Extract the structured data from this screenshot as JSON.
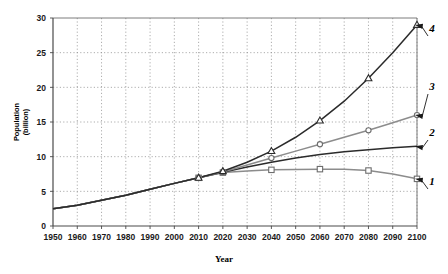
{
  "chart_data": {
    "type": "line",
    "title": "",
    "xlabel": "Year",
    "ylabel": "Population (billion)",
    "ylabel_line1": "Population",
    "ylabel_line2": "(billion)",
    "xlim": [
      1950,
      2100
    ],
    "ylim": [
      0,
      30
    ],
    "xticks": [
      1950,
      1960,
      1970,
      1980,
      1990,
      2000,
      2010,
      2020,
      2030,
      2040,
      2050,
      2060,
      2070,
      2080,
      2090,
      2100
    ],
    "yticks": [
      0,
      5,
      10,
      15,
      20,
      25,
      30
    ],
    "xtick_labels": [
      "1950",
      "1960",
      "1970",
      "1980",
      "1990",
      "2000",
      "2010",
      "2020",
      "2030",
      "2040",
      "2050",
      "2060",
      "2070",
      "2080",
      "2090",
      "2100"
    ],
    "ytick_labels": [
      "0",
      "5",
      "10",
      "15",
      "20",
      "25",
      "30"
    ],
    "grid": true,
    "legend_position": "inline-right-annotations",
    "x": [
      1950,
      1960,
      1970,
      1980,
      1990,
      2000,
      2010,
      2020,
      2030,
      2040,
      2050,
      2060,
      2070,
      2080,
      2090,
      2100
    ],
    "series": [
      {
        "name": "1",
        "label": "1",
        "marker": "square",
        "color": "#8c8c8c",
        "values": [
          2.5,
          3.0,
          3.7,
          4.45,
          5.3,
          6.15,
          6.95,
          7.7,
          7.95,
          8.1,
          8.15,
          8.2,
          8.2,
          8.0,
          7.5,
          6.8
        ]
      },
      {
        "name": "2",
        "label": "2",
        "marker": "none",
        "color": "#2b2b2b",
        "values": [
          2.5,
          3.0,
          3.7,
          4.45,
          5.3,
          6.15,
          6.95,
          7.75,
          8.5,
          9.2,
          9.8,
          10.3,
          10.7,
          11.0,
          11.3,
          11.5
        ]
      },
      {
        "name": "3",
        "label": "3",
        "marker": "circle",
        "color": "#8c8c8c",
        "values": [
          2.5,
          3.0,
          3.7,
          4.45,
          5.3,
          6.15,
          6.95,
          7.8,
          8.8,
          9.8,
          10.8,
          11.8,
          12.8,
          13.8,
          14.9,
          16.0
        ]
      },
      {
        "name": "4",
        "label": "4",
        "marker": "triangle",
        "color": "#2b2b2b",
        "values": [
          2.5,
          3.0,
          3.7,
          4.45,
          5.3,
          6.15,
          6.95,
          7.9,
          9.2,
          10.8,
          12.8,
          15.2,
          18.0,
          21.3,
          25.0,
          29.0
        ]
      }
    ],
    "annotations": [
      {
        "label": "4",
        "x": 2100,
        "y": 29.0
      },
      {
        "label": "3",
        "x": 2100,
        "y": 16.0
      },
      {
        "label": "2",
        "x": 2100,
        "y": 11.5
      },
      {
        "label": "1",
        "x": 2100,
        "y": 6.8
      }
    ]
  }
}
